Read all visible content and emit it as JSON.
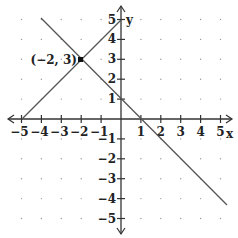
{
  "chart_data": {
    "type": "line",
    "title": "",
    "xlabel": "x",
    "ylabel": "y",
    "xlim": [
      -5,
      5
    ],
    "ylim": [
      -5,
      5
    ],
    "grid": "dots",
    "x_ticks": [
      "-5",
      "-4",
      "-3",
      "-2",
      "-1",
      "1",
      "2",
      "3",
      "4",
      "5"
    ],
    "y_ticks": [
      "5",
      "4",
      "3",
      "2",
      "1",
      "-1",
      "-2",
      "-3",
      "-4",
      "-5"
    ],
    "series": [
      {
        "name": "line-1",
        "equation": "y = -x + 1",
        "x": [
          -4,
          5.3
        ],
        "y": [
          5,
          -4.3
        ]
      },
      {
        "name": "line-2",
        "equation": "y = x + 5",
        "x": [
          -5,
          0
        ],
        "y": [
          0,
          5
        ]
      }
    ],
    "annotations": [
      {
        "label": "(-2, 3)",
        "x": -2,
        "y": 3,
        "marker": "square"
      }
    ]
  },
  "labels": {
    "x_axis": "x",
    "y_axis": "y",
    "point": "(−2, 3)",
    "xt": [
      "−5",
      "−4",
      "−3",
      "−2",
      "−1",
      "1",
      "2",
      "3",
      "4",
      "5"
    ],
    "yt": [
      "5",
      "4",
      "3",
      "2",
      "1",
      "−1",
      "−2",
      "−3",
      "−4",
      "−5"
    ]
  }
}
